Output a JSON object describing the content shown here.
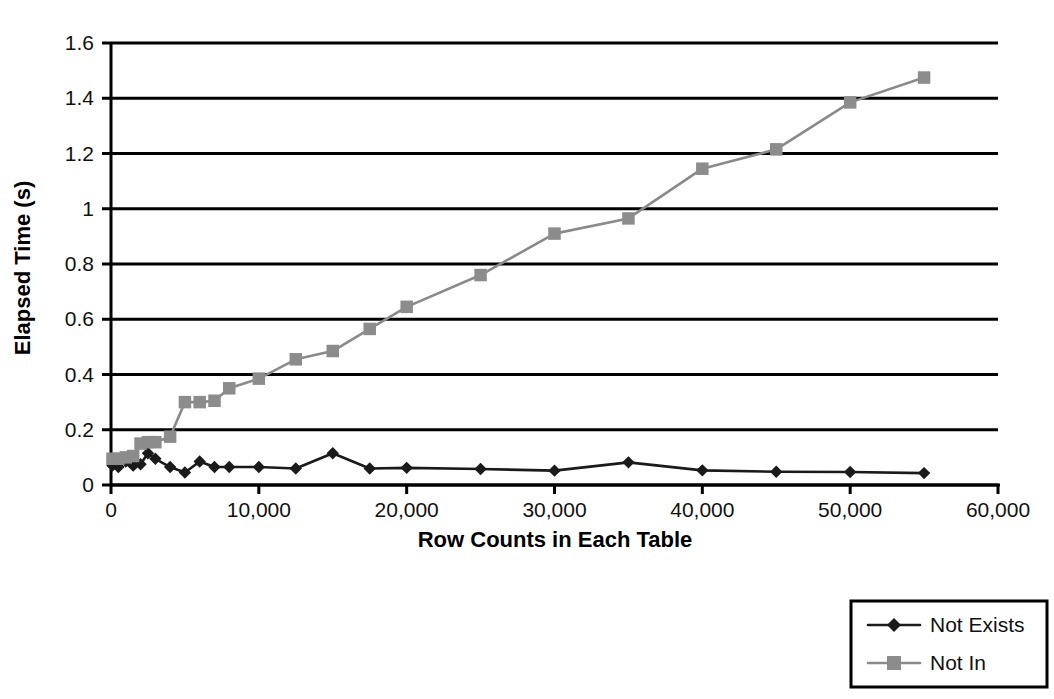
{
  "chart_data": {
    "type": "line",
    "title": "",
    "xlabel": "Row Counts in Each Table",
    "ylabel": "Elapsed Time (s)",
    "xlim": [
      0,
      60000
    ],
    "ylim": [
      0,
      1.6
    ],
    "xticks": [
      0,
      10000,
      20000,
      30000,
      40000,
      50000,
      60000
    ],
    "xticklabels": [
      "0",
      "10,000",
      "20,000",
      "30,000",
      "40,000",
      "50,000",
      "60,000"
    ],
    "yticks": [
      0,
      0.2,
      0.4,
      0.6,
      0.8,
      1,
      1.2,
      1.4,
      1.6
    ],
    "yticklabels": [
      "0",
      "0.2",
      "0.4",
      "0.6",
      "0.8",
      "1",
      "1.2",
      "1.4",
      "1.6"
    ],
    "grid": "horizontal",
    "legend_position": "bottom-right",
    "series": [
      {
        "name": "Not Exists",
        "color": "#1a1a1a",
        "marker": "diamond",
        "x": [
          100,
          500,
          1000,
          1500,
          2000,
          2500,
          3000,
          4000,
          5000,
          6000,
          7000,
          8000,
          10000,
          12500,
          15000,
          17500,
          20000,
          25000,
          30000,
          35000,
          40000,
          45000,
          50000,
          55000
        ],
        "y": [
          0.07,
          0.065,
          0.085,
          0.07,
          0.075,
          0.115,
          0.095,
          0.065,
          0.045,
          0.085,
          0.065,
          0.065,
          0.065,
          0.06,
          0.115,
          0.06,
          0.062,
          0.058,
          0.052,
          0.082,
          0.053,
          0.048,
          0.047,
          0.043
        ]
      },
      {
        "name": "Not In",
        "color": "#8c8c8c",
        "marker": "square",
        "x": [
          100,
          500,
          1000,
          1500,
          2000,
          2500,
          3000,
          4000,
          5000,
          6000,
          7000,
          8000,
          10000,
          12500,
          15000,
          17500,
          20000,
          25000,
          30000,
          35000,
          40000,
          45000,
          50000,
          55000
        ],
        "y": [
          0.095,
          0.095,
          0.1,
          0.105,
          0.15,
          0.155,
          0.155,
          0.175,
          0.3,
          0.3,
          0.305,
          0.35,
          0.385,
          0.455,
          0.485,
          0.565,
          0.645,
          0.76,
          0.91,
          0.965,
          1.145,
          1.215,
          1.385,
          1.475
        ]
      }
    ],
    "legend": [
      {
        "label": "Not Exists",
        "marker": "diamond",
        "color": "#1a1a1a"
      },
      {
        "label": "Not In",
        "marker": "square",
        "color": "#8c8c8c"
      }
    ]
  }
}
